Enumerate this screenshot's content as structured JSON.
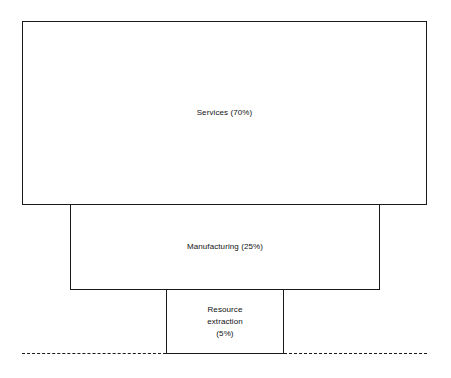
{
  "diagram": {
    "type": "inverted-pyramid-sector-diagram",
    "background_color": "#ffffff",
    "stroke_color": "#1a1a1a",
    "fill_color": "#ffffff",
    "text_color": "#111111",
    "ground_line": {
      "name": "ground-line",
      "style": "dashed",
      "color": "#1a1a1a"
    },
    "layers": [
      {
        "id": "services",
        "label": "Services (70%)",
        "sector": "Services",
        "percent": 70,
        "rank": 1,
        "width_rank": "widest"
      },
      {
        "id": "manufacturing",
        "label": "Manufacturing (25%)",
        "sector": "Manufacturing",
        "percent": 25,
        "rank": 2,
        "width_rank": "medium"
      },
      {
        "id": "resource_extraction",
        "label": "Resource\nextraction\n(5%)",
        "sector": "Resource extraction",
        "percent": 5,
        "rank": 3,
        "width_rank": "narrowest"
      }
    ]
  },
  "chart_data": {
    "type": "bar",
    "title": "",
    "xlabel": "",
    "ylabel": "",
    "categories": [
      "Services",
      "Manufacturing",
      "Resource extraction"
    ],
    "values": [
      70,
      25,
      5
    ],
    "value_unit": "%",
    "labels": [
      "Services (70%)",
      "Manufacturing (25%)",
      "Resource extraction (5%)"
    ],
    "orientation": "stacked-inverted-pyramid",
    "grid": false,
    "legend": "none"
  }
}
